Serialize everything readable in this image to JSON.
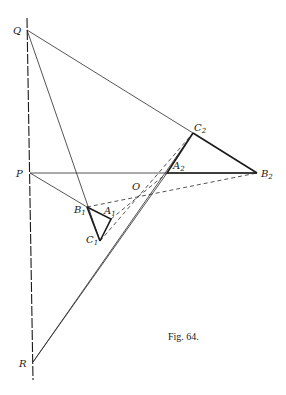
{
  "figure": {
    "caption": "Fig. 64.",
    "points": {
      "Q": {
        "label": "Q",
        "sub": "",
        "x": 27,
        "y": 30
      },
      "P": {
        "label": "P",
        "sub": "",
        "x": 30,
        "y": 173
      },
      "R": {
        "label": "R",
        "sub": "",
        "x": 33,
        "y": 362
      },
      "A1": {
        "label": "A",
        "sub": "1",
        "x": 111,
        "y": 219
      },
      "B1": {
        "label": "B",
        "sub": "1",
        "x": 87,
        "y": 207
      },
      "C1": {
        "label": "C",
        "sub": "1",
        "x": 100,
        "y": 241
      },
      "A2": {
        "label": "A",
        "sub": "2",
        "x": 167,
        "y": 173
      },
      "B2": {
        "label": "B",
        "sub": "2",
        "x": 257,
        "y": 173
      },
      "C2": {
        "label": "C",
        "sub": "2",
        "x": 193,
        "y": 133
      },
      "O": {
        "label": "O",
        "sub": "",
        "x": 139,
        "y": 193
      }
    }
  }
}
